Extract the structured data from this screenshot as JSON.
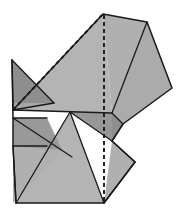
{
  "figure": {
    "canvas": {
      "width": 187,
      "height": 220,
      "background": "#ffffff"
    },
    "palette": {
      "fill_light": "#b4b4b4",
      "fill_mid": "#a8a8a8",
      "fill_dark": "#999999",
      "fill_darker": "#8e8e8e",
      "stroke": "#1a1a1a",
      "background": "#ffffff"
    },
    "line_styles": {
      "solid_width": 1.4,
      "dashed_width": 1.8,
      "dash_pattern": "4 3"
    },
    "faces": [
      {
        "name": "upper-left-wing-dark",
        "tone": "fill_darker",
        "points": "12,60 54,103 13,110"
      },
      {
        "name": "upper-left-wing-light",
        "tone": "fill_mid",
        "points": "12,60 54,103 13,110 12,60"
      },
      {
        "name": "upper-large-panel",
        "tone": "fill_light",
        "points": "103,14 112,113 13,110"
      },
      {
        "name": "top-right-panel",
        "tone": "fill_light",
        "points": "103,14 147,22 112,113"
      },
      {
        "name": "right-wing-panel",
        "tone": "fill_mid",
        "points": "147,22 172,88 123,124 112,113"
      },
      {
        "name": "center-dark-triangle",
        "tone": "fill_dark",
        "points": "70,112 112,113 112,141"
      },
      {
        "name": "left-dark-band",
        "tone": "fill_dark",
        "points": "13,118 47,118 47,146 13,146"
      },
      {
        "name": "mid-left-panel",
        "tone": "fill_mid",
        "points": "13,110 112,113 70,112"
      },
      {
        "name": "lower-left-flap",
        "tone": "fill_light",
        "points": "13,146 16,203 62,150"
      },
      {
        "name": "lower-center-sweep",
        "tone": "fill_light",
        "points": "70,112 104,203 16,203"
      },
      {
        "name": "lower-right-flap",
        "tone": "fill_light",
        "points": "112,141 135,162 104,203"
      },
      {
        "name": "lower-right-panel",
        "tone": "fill_mid",
        "points": "112,113 123,124 112,141"
      }
    ],
    "fold_lines": {
      "mountain_dashed": [
        {
          "name": "top-ridge-dashed",
          "from": [
            103,
            14
          ],
          "to": [
            104,
            113
          ]
        },
        {
          "name": "bottom-ridge-dashed",
          "from": [
            104,
            113
          ],
          "to": [
            104,
            203
          ]
        },
        {
          "name": "upper-left-dashed",
          "from": [
            103,
            14
          ],
          "to": [
            13,
            110
          ]
        }
      ],
      "valley_solid": [
        {
          "name": "left-wing-edge",
          "from": [
            12,
            60
          ],
          "to": [
            13,
            110
          ]
        },
        {
          "name": "left-wing-diagonal",
          "from": [
            12,
            60
          ],
          "to": [
            54,
            103
          ]
        },
        {
          "name": "left-wing-lower",
          "from": [
            54,
            103
          ],
          "to": [
            13,
            110
          ]
        },
        {
          "name": "center-horizontal",
          "from": [
            13,
            110
          ],
          "to": [
            112,
            113
          ]
        },
        {
          "name": "band-top",
          "from": [
            13,
            118
          ],
          "to": [
            47,
            118
          ]
        },
        {
          "name": "band-bottom",
          "from": [
            13,
            146
          ],
          "to": [
            47,
            146
          ]
        },
        {
          "name": "band-right-diagonal",
          "from": [
            13,
            118
          ],
          "to": [
            62,
            150
          ]
        },
        {
          "name": "dark-tri-diagonal",
          "from": [
            70,
            112
          ],
          "to": [
            112,
            141
          ]
        },
        {
          "name": "sweep-left-edge",
          "from": [
            70,
            112
          ],
          "to": [
            16,
            203
          ]
        },
        {
          "name": "sweep-right-edge",
          "from": [
            70,
            112
          ],
          "to": [
            104,
            203
          ]
        },
        {
          "name": "left-flap-edge",
          "from": [
            13,
            146
          ],
          "to": [
            16,
            203
          ]
        },
        {
          "name": "right-panel-diag",
          "from": [
            147,
            22
          ],
          "to": [
            112,
            113
          ]
        },
        {
          "name": "right-notch-upper",
          "from": [
            112,
            113
          ],
          "to": [
            123,
            124
          ]
        },
        {
          "name": "right-notch-lower",
          "from": [
            123,
            124
          ],
          "to": [
            112,
            141
          ]
        },
        {
          "name": "right-flap-upper",
          "from": [
            112,
            141
          ],
          "to": [
            135,
            162
          ]
        },
        {
          "name": "right-flap-lower",
          "from": [
            135,
            162
          ],
          "to": [
            104,
            203
          ]
        }
      ]
    },
    "outline": "103,14 147,22 172,88 123,124 112,141 135,162 104,203 16,203 13,146 13,118 12,60 13,110"
  }
}
